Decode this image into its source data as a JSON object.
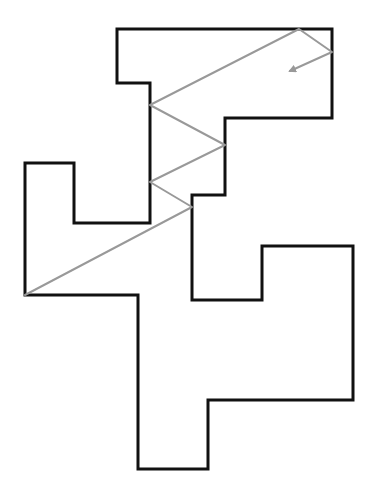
{
  "diagram": {
    "type": "reflection-path-in-polygon",
    "width": 377,
    "height": 497,
    "room": {
      "stroke": "#111111",
      "stroke_width": 3,
      "points": [
        [
          117,
          29
        ],
        [
          332,
          29
        ],
        [
          332,
          118
        ],
        [
          225,
          118
        ],
        [
          225,
          195
        ],
        [
          192,
          195
        ],
        [
          192,
          300
        ],
        [
          262,
          300
        ],
        [
          262,
          246
        ],
        [
          353,
          246
        ],
        [
          353,
          400
        ],
        [
          208,
          400
        ],
        [
          208,
          469
        ],
        [
          138,
          469
        ],
        [
          138,
          295
        ],
        [
          25,
          295
        ],
        [
          25,
          163
        ],
        [
          74,
          163
        ],
        [
          74,
          223
        ],
        [
          150,
          223
        ],
        [
          150,
          83
        ],
        [
          117,
          83
        ]
      ]
    },
    "ray": {
      "stroke": "#999999",
      "stroke_width": 2,
      "points": [
        [
          25,
          295
        ],
        [
          192,
          207
        ],
        [
          150,
          182
        ],
        [
          225,
          145
        ],
        [
          150,
          105
        ],
        [
          299,
          29
        ],
        [
          332,
          52
        ],
        [
          290,
          71
        ]
      ],
      "arrow_tip": [
        288,
        72
      ]
    }
  }
}
